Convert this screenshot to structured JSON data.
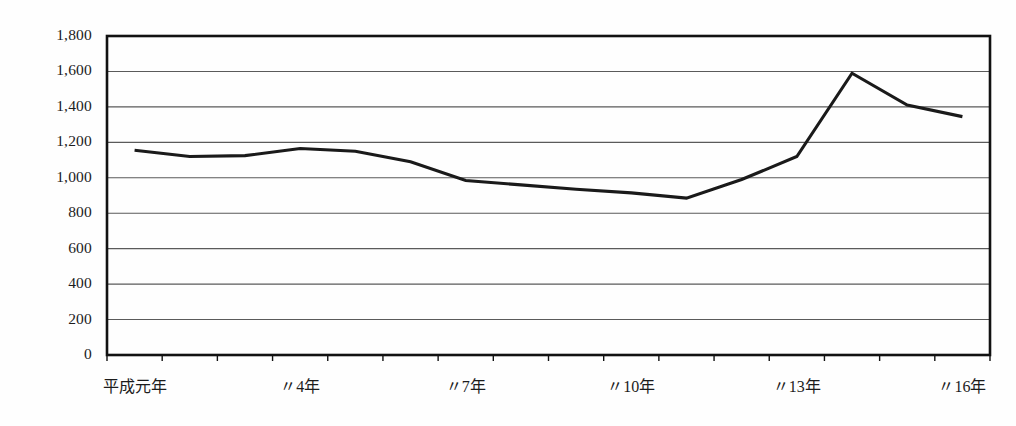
{
  "chart_data": {
    "type": "line",
    "title": "",
    "xlabel": "",
    "ylabel": "",
    "categories": [
      "平成元年",
      "平成2年",
      "平成3年",
      "平成4年",
      "平成5年",
      "平成6年",
      "平成7年",
      "平成8年",
      "平成9年",
      "平成10年",
      "平成11年",
      "平成12年",
      "平成13年",
      "平成14年",
      "平成15年",
      "平成16年"
    ],
    "values": [
      1155,
      1120,
      1125,
      1165,
      1150,
      1090,
      985,
      960,
      935,
      915,
      885,
      990,
      1120,
      1590,
      1410,
      1345
    ],
    "ylim": [
      0,
      1800
    ],
    "ytick_values": [
      0,
      200,
      400,
      600,
      800,
      1000,
      1200,
      1400,
      1600,
      1800
    ],
    "ytick_labels": [
      "0",
      "200",
      "400",
      "600",
      "800",
      "1,000",
      "1,200",
      "1,400",
      "1,600",
      "1,800"
    ],
    "xtick_labels_visible": [
      "平成元年",
      "〃4年",
      "〃7年",
      "〃10年",
      "〃16年"
    ],
    "grid": true,
    "legend": "none",
    "series": [
      {
        "name": "件数",
        "values": [
          1155,
          1120,
          1125,
          1165,
          1150,
          1090,
          985,
          960,
          935,
          915,
          885,
          990,
          1120,
          1590,
          1410,
          1345
        ]
      }
    ]
  },
  "axes": {
    "y_labels": [
      "1,800",
      "1,600",
      "1,400",
      "1,200",
      "1,000",
      "800",
      "600",
      "400",
      "200",
      "0"
    ],
    "x_labels": [
      {
        "text": "平成元年",
        "index": 0
      },
      {
        "text": "〃4年",
        "index": 3
      },
      {
        "text": "〃7年",
        "index": 6
      },
      {
        "text": "〃10年",
        "index": 9
      },
      {
        "text": "〃13年",
        "index": 12
      },
      {
        "text": "〃16年",
        "index": 15
      }
    ]
  },
  "colors": {
    "line": "#1a1a1a",
    "grid": "#5a5a5a",
    "frame": "#111111",
    "background": "#fefefe"
  },
  "header": {
    "title": ""
  }
}
